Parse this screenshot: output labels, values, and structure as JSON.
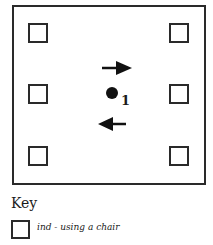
{
  "diagram": {
    "chairs": [
      {
        "id": "chair-top-left",
        "x": 28,
        "y": 23
      },
      {
        "id": "chair-top-right",
        "x": 169,
        "y": 23
      },
      {
        "id": "chair-mid-left",
        "x": 28,
        "y": 84
      },
      {
        "id": "chair-mid-right",
        "x": 169,
        "y": 84
      },
      {
        "id": "chair-bottom-left",
        "x": 28,
        "y": 146
      },
      {
        "id": "chair-bottom-right",
        "x": 169,
        "y": 146
      }
    ],
    "person_label": "1",
    "arrows": [
      {
        "direction": "right"
      },
      {
        "direction": "left"
      }
    ]
  },
  "key": {
    "title": "Key",
    "items": [
      {
        "symbol": "square",
        "label": "ind - using a chair"
      }
    ]
  }
}
